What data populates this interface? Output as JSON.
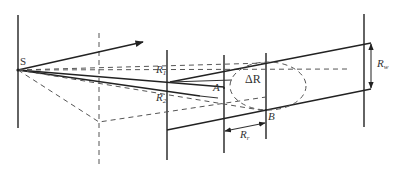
{
  "diagram": {
    "labels": {
      "source": "S",
      "r1": "R",
      "r1_sub": "1",
      "r2": "R",
      "r2_sub": "2",
      "point_a": "A",
      "point_b": "B",
      "delta_r": "ΔR",
      "rr": "R",
      "rr_sub": "r",
      "rw": "R",
      "rw_sub": "w"
    },
    "colors": {
      "line": "#222222",
      "dashed": "#555555",
      "text": "#333333",
      "background": "#ffffff"
    }
  }
}
